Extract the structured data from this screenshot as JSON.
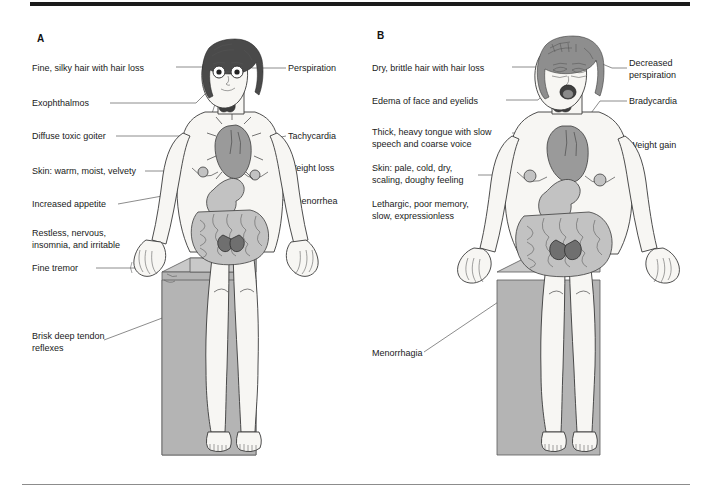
{
  "figure": {
    "type": "medical-illustration",
    "background_color": "#ffffff",
    "rule_color": "#8c8c8c",
    "top_bar_color": "#1b1b1b",
    "block_color": "#b4b4b4",
    "organ_color": "#9a9a9a"
  },
  "panels": [
    {
      "id": "A",
      "letter": "A",
      "condition": "hyperthyroidism",
      "labels_left": [
        {
          "text": "Fine, silky hair with hair loss",
          "name": "label-fine-silky-hair"
        },
        {
          "text": "Exophthalmos",
          "name": "label-exophthalmos"
        },
        {
          "text": "Diffuse toxic goiter",
          "name": "label-diffuse-toxic-goiter"
        },
        {
          "text": "Skin: warm, moist, velvety",
          "name": "label-skin-warm-moist-velvety"
        },
        {
          "text": "Increased appetite",
          "name": "label-increased-appetite"
        },
        {
          "text": "Restless, nervous,\ninsomnia, and irritable",
          "name": "label-restless-nervous"
        },
        {
          "text": "Fine tremor",
          "name": "label-fine-tremor"
        },
        {
          "text": "Brisk deep tendon\nreflexes",
          "name": "label-brisk-deep-tendon-reflexes"
        }
      ],
      "labels_right": [
        {
          "text": "Perspiration",
          "name": "label-perspiration"
        },
        {
          "text": "Tachycardia",
          "name": "label-tachycardia"
        },
        {
          "text": "Weight loss",
          "name": "label-weight-loss"
        },
        {
          "text": "Amenorrhea",
          "name": "label-amenorrhea"
        }
      ]
    },
    {
      "id": "B",
      "letter": "B",
      "condition": "hypothyroidism",
      "labels_left": [
        {
          "text": "Dry, brittle hair with hair loss",
          "name": "label-dry-brittle-hair"
        },
        {
          "text": "Edema of face and eyelids",
          "name": "label-edema-face-eyelids"
        },
        {
          "text": "Thick, heavy tongue with slow\nspeech and coarse voice",
          "name": "label-thick-heavy-tongue"
        },
        {
          "text": "Skin: pale, cold, dry,\nscaling, doughy feeling",
          "name": "label-skin-pale-cold-dry"
        },
        {
          "text": "Lethargic, poor memory,\nslow, expressionless",
          "name": "label-lethargic-poor-memory"
        },
        {
          "text": "Menorrhagia",
          "name": "label-menorrhagia"
        }
      ],
      "labels_right": [
        {
          "text": "Decreased\nperspiration",
          "name": "label-decreased-perspiration"
        },
        {
          "text": "Bradycardia",
          "name": "label-bradycardia"
        },
        {
          "text": "Weight gain",
          "name": "label-weight-gain"
        }
      ]
    }
  ]
}
